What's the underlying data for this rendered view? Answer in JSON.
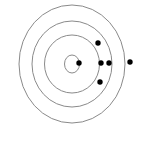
{
  "diagram": {
    "type": "target-rings",
    "center": [
      72,
      64
    ],
    "ring_color": "#8a8a8a",
    "dot_color": "#000000",
    "dot_radius": 2.7,
    "rings": [
      {
        "rx": 53,
        "ry": 59
      },
      {
        "rx": 40,
        "ry": 43
      },
      {
        "rx": 27.5,
        "ry": 29
      },
      {
        "rx": 7.5,
        "ry": 9
      }
    ],
    "dots": [
      {
        "x": 79,
        "y": 63
      },
      {
        "x": 98,
        "y": 43
      },
      {
        "x": 101,
        "y": 63
      },
      {
        "x": 109,
        "y": 63
      },
      {
        "x": 100,
        "y": 82
      },
      {
        "x": 130,
        "y": 62
      }
    ]
  }
}
